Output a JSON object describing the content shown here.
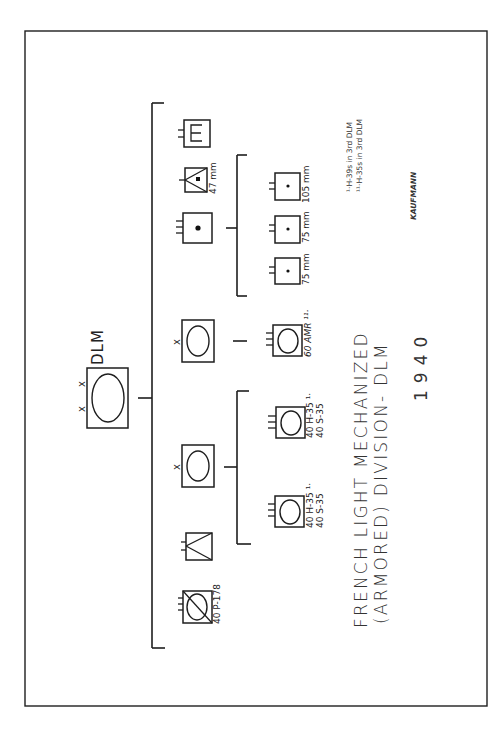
{
  "diagram": {
    "title_line1": "FRENCH LIGHT MECHANIZED",
    "title_line2": "(ARMORED) DIVISION- DLM",
    "year": "1940",
    "author": "KAUFMANN",
    "footnotes": [
      "¹·H-39s in 3rd DLM",
      "¹¹·H-35s in 3rd DLM"
    ],
    "headquarters": {
      "label": "DLM",
      "echelon": "X X",
      "symbol": "armor-division"
    },
    "units": [
      {
        "id": "recon",
        "symbol": "armored-cavalry-recon",
        "echelon": "",
        "label": "40 P-178"
      },
      {
        "id": "dragoons",
        "symbol": "motorized-infantry",
        "echelon": "",
        "label": ""
      },
      {
        "id": "light-armor-brigade",
        "symbol": "armor",
        "echelon": "x",
        "label": "",
        "children": [
          {
            "symbol": "armor",
            "label_line1": "40 H-35 ¹·",
            "label_line2": "40 S-35"
          },
          {
            "symbol": "armor",
            "label_line1": "40 H-35 ¹·",
            "label_line2": "40 S-35"
          }
        ]
      },
      {
        "id": "recon-brigade",
        "symbol": "armor",
        "echelon": "x",
        "label": "",
        "children": [
          {
            "symbol": "armor",
            "label_line1": "60 AMR ¹¹·",
            "label_line2": ""
          }
        ]
      },
      {
        "id": "artillery-regiment",
        "symbol": "artillery",
        "echelon": "",
        "label": "",
        "children": [
          {
            "symbol": "artillery",
            "label": "75 mm"
          },
          {
            "symbol": "artillery",
            "label": "75 mm"
          },
          {
            "symbol": "artillery",
            "label": "105 mm"
          }
        ]
      },
      {
        "id": "anti-tank",
        "symbol": "anti-tank",
        "echelon": "",
        "label": "47 mm"
      },
      {
        "id": "engineers",
        "symbol": "engineer",
        "echelon": "",
        "label": ""
      }
    ]
  }
}
